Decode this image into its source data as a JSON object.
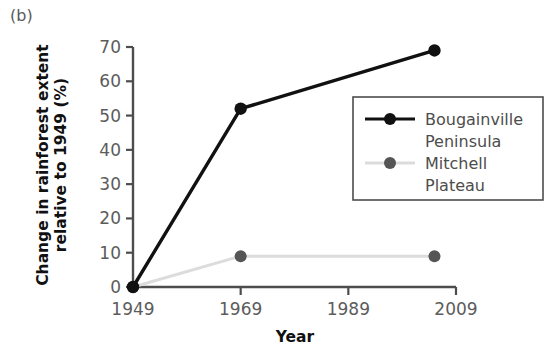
{
  "panel": {
    "label": "(b)"
  },
  "chart_data": {
    "type": "line",
    "title": "",
    "subtitle": "",
    "xlabel": "Year",
    "ylabel": "Change in rainforest extent relative to 1949 (%)",
    "ylabel_line1": "Change in rainforest extent",
    "ylabel_line2": "relative to 1949 (%)",
    "xlim": [
      1949,
      2009
    ],
    "ylim": [
      0,
      70
    ],
    "xticks": [
      1949,
      1969,
      1989,
      2009
    ],
    "yticks": [
      0,
      10,
      20,
      30,
      40,
      50,
      60,
      70
    ],
    "xtick_labels": [
      "1949",
      "1969",
      "1989",
      "2009"
    ],
    "ytick_labels": [
      "0",
      "10",
      "20",
      "30",
      "40",
      "50",
      "60",
      "70"
    ],
    "grid": false,
    "legend_position": "right-upper",
    "series": [
      {
        "name": "Bougainville Peninsula",
        "legend_line1": "Bougainville",
        "legend_line2": "Peninsula",
        "color": "#111111",
        "line_color": "#111111",
        "marker": "circle",
        "x": [
          1949,
          1969,
          2005
        ],
        "values": [
          0,
          52,
          69
        ]
      },
      {
        "name": "Mitchell Plateau",
        "legend_line1": "Mitchell",
        "legend_line2": "Plateau",
        "color": "#555555",
        "line_color": "#dcdcdc",
        "marker": "circle",
        "x": [
          1949,
          1969,
          2005
        ],
        "values": [
          0,
          9,
          9
        ]
      }
    ]
  },
  "colors": {
    "axis": "#4d4d4d",
    "tick_label": "#5c5c5c",
    "axis_label": "#111111",
    "legend_border": "#4d4d4d",
    "series_black": "#111111",
    "series_gray_marker": "#555555",
    "series_gray_line": "#dcdcdc",
    "background": "#ffffff"
  }
}
